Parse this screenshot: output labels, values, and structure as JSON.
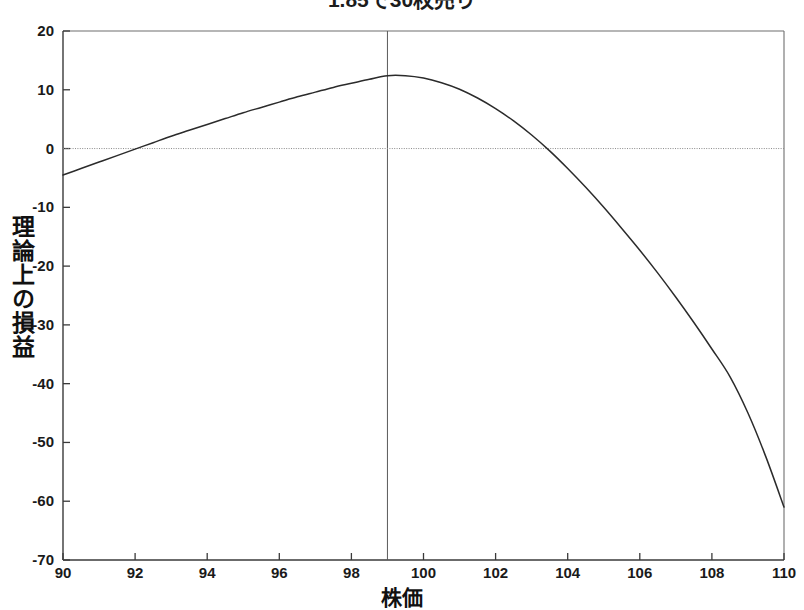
{
  "chart_data": {
    "type": "line",
    "title": "1.85で30枚売り",
    "xlabel": "株価",
    "ylabel": "理論上の損益",
    "xlim": [
      90,
      110
    ],
    "ylim": [
      -70,
      20
    ],
    "xticks": [
      90,
      92,
      94,
      96,
      98,
      100,
      102,
      104,
      106,
      108,
      110
    ],
    "xtick_labels": [
      "90",
      "92",
      "94",
      "96",
      "98",
      "100",
      "102",
      "104",
      "106",
      "108",
      "110"
    ],
    "yticks": [
      20,
      10,
      0,
      -10,
      -20,
      -30,
      -40,
      -50,
      -60,
      -70
    ],
    "ytick_labels": [
      "20",
      "10",
      "0",
      "-10",
      "-20",
      "-30",
      "-40",
      "-50",
      "-60",
      "-70"
    ],
    "grid": false,
    "legend": null,
    "reference_lines": [
      {
        "name": "current-price-line",
        "orientation": "vertical",
        "value": 99,
        "style": "solid"
      },
      {
        "name": "zero-profit-line",
        "orientation": "horizontal",
        "value": 0,
        "style": "dotted"
      }
    ],
    "series": [
      {
        "name": "理論上の損益",
        "color": "#2b2b2b",
        "x": [
          90,
          90.5,
          91,
          91.5,
          92,
          92.5,
          93,
          93.5,
          94,
          94.5,
          95,
          95.5,
          96,
          96.5,
          97,
          97.5,
          98,
          98.5,
          99,
          99.5,
          100,
          100.5,
          101,
          101.5,
          102,
          102.5,
          103,
          103.5,
          104,
          104.5,
          105,
          105.5,
          106,
          106.5,
          107,
          107.5,
          108,
          108.5,
          109,
          109.5,
          110
        ],
        "values": [
          -4.5,
          -3.4,
          -2.3,
          -1.2,
          -0.1,
          1.0,
          2.1,
          3.1,
          4.1,
          5.1,
          6.1,
          7.0,
          7.9,
          8.8,
          9.6,
          10.4,
          11.1,
          11.8,
          12.4,
          12.4,
          12.0,
          11.2,
          10.1,
          8.6,
          6.8,
          4.7,
          2.3,
          -0.4,
          -3.4,
          -6.6,
          -10.0,
          -13.6,
          -17.3,
          -21.2,
          -25.3,
          -29.6,
          -34.1,
          -38.8,
          -45.0,
          -52.5,
          -61.0
        ]
      }
    ],
    "annotations": {
      "peak_x": 99,
      "peak_y": 12.4,
      "left_breakeven_x": 92,
      "right_breakeven_x": 103.7,
      "left_endpoint_y": -4.5,
      "right_endpoint_y": -61.0
    },
    "colors": {
      "curve": "#2b2b2b",
      "axis": "#3a3a3a",
      "frame": "#6f6f6f",
      "text": "#1a1a1a",
      "background": "#ffffff"
    }
  }
}
